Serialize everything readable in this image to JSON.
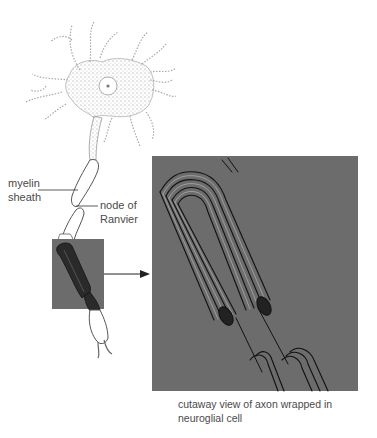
{
  "figure": {
    "labels": {
      "myelin_sheath": [
        "myelin",
        "sheath"
      ],
      "node_of_ranvier": [
        "node of",
        "Ranvier"
      ]
    },
    "caption": [
      "cutaway view of axon wrapped in",
      "neuroglial cell"
    ],
    "parts": [
      {
        "name": "neuron-cell-body",
        "desc": "stippled cell body with dendrites and nucleus"
      },
      {
        "name": "axon",
        "desc": "axon descending from cell body"
      },
      {
        "name": "myelin-sheath-segments",
        "desc": "white myelin segments separated by nodes"
      },
      {
        "name": "zoom-box",
        "desc": "gray highlighted region of axon"
      },
      {
        "name": "cutaway-panel",
        "desc": "enlarged cutaway view showing concentric myelin layers"
      }
    ],
    "colors": {
      "panel_gray": "#6c6c6c",
      "line_dark": "#1a1a1a",
      "stipple": "#8a8a8a",
      "text": "#4a4a4a"
    }
  }
}
